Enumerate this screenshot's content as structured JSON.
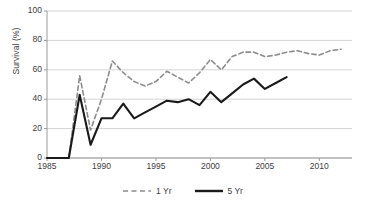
{
  "chart_data": {
    "type": "line",
    "title": "",
    "xlabel": "",
    "ylabel": "Survival (%)",
    "xlim": [
      1985,
      2013
    ],
    "ylim": [
      0,
      100
    ],
    "xticks": [
      1985,
      1990,
      1995,
      2000,
      2005,
      2010
    ],
    "yticks": [
      0,
      20,
      40,
      60,
      80,
      100
    ],
    "grid": "horizontal",
    "legend_position": "bottom-center",
    "series": [
      {
        "name": "1 Yr",
        "style": "dashed",
        "color": "#8c8c8c",
        "x": [
          1985,
          1986,
          1987,
          1988,
          1989,
          1990,
          1991,
          1992,
          1993,
          1994,
          1995,
          1996,
          1997,
          1998,
          1999,
          2000,
          2001,
          2002,
          2003,
          2004,
          2005,
          2006,
          2007,
          2008,
          2009,
          2010,
          2011,
          2012
        ],
        "values": [
          0,
          0,
          0,
          56,
          19,
          40,
          66,
          58,
          52,
          49,
          52,
          59,
          55,
          51,
          58,
          67,
          60,
          69,
          72,
          72,
          69,
          70,
          72,
          73,
          71,
          70,
          73,
          74
        ]
      },
      {
        "name": "5 Yr",
        "style": "solid",
        "color": "#1a1a1a",
        "x": [
          1985,
          1986,
          1987,
          1988,
          1989,
          1990,
          1991,
          1992,
          1993,
          1994,
          1995,
          1996,
          1997,
          1998,
          1999,
          2000,
          2001,
          2002,
          2003,
          2004,
          2005,
          2006,
          2007
        ],
        "values": [
          0,
          0,
          0,
          43,
          9,
          27,
          27,
          37,
          27,
          31,
          35,
          39,
          38,
          40,
          36,
          45,
          38,
          44,
          50,
          54,
          47,
          51,
          55
        ]
      }
    ]
  },
  "legend": {
    "entries": [
      {
        "label": "1 Yr",
        "style": "dashed",
        "color": "#8c8c8c"
      },
      {
        "label": "5 Yr",
        "style": "solid",
        "color": "#1a1a1a"
      }
    ]
  },
  "axes": {
    "y_title": "Survival (%)",
    "y_labels": [
      "100",
      "80",
      "60",
      "40",
      "20",
      "0"
    ],
    "x_labels": [
      "1985",
      "1990",
      "1995",
      "2000",
      "2005",
      "2010"
    ]
  },
  "colors": {
    "grid": "#d4d4d4",
    "axis": "#9a9a9a",
    "text": "#3d3d3d",
    "series_1yr": "#8c8c8c",
    "series_5yr": "#1a1a1a",
    "background": "#ffffff"
  }
}
